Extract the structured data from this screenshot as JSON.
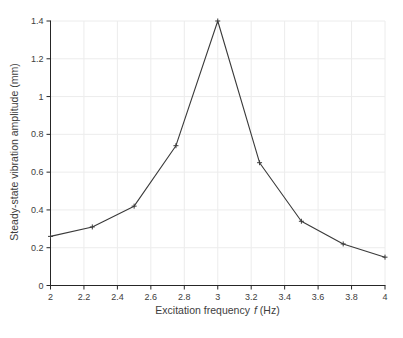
{
  "figure": {
    "background": "#ffffff"
  },
  "chart_data": {
    "type": "line",
    "title": "",
    "xlabel_prefix": "Excitation frequency",
    "xlabel_symbol": "f",
    "xlabel_suffix": "(Hz)",
    "ylabel": "Steady-state vibration amplitude (mm)",
    "x": [
      2,
      2.25,
      2.5,
      2.75,
      3,
      3.25,
      3.5,
      3.75,
      4
    ],
    "y": [
      0.26,
      0.31,
      0.42,
      0.74,
      1.4,
      0.65,
      0.34,
      0.22,
      0.15
    ],
    "xlim": [
      2,
      4
    ],
    "ylim": [
      0,
      1.4
    ],
    "xticks": [
      2,
      2.2,
      2.4,
      2.6,
      2.8,
      3,
      3.2,
      3.4,
      3.6,
      3.8,
      4
    ],
    "xtick_labels": [
      "2",
      "2.2",
      "2.4",
      "2.6",
      "2.8",
      "3",
      "3.2",
      "3.4",
      "3.6",
      "3.8",
      "4"
    ],
    "yticks": [
      0,
      0.2,
      0.4,
      0.6,
      0.8,
      1,
      1.2,
      1.4
    ],
    "ytick_labels": [
      "0",
      "0.2",
      "0.4",
      "0.6",
      "0.8",
      "1",
      "1.2",
      "1.4"
    ],
    "grid": true,
    "legend_position": "none",
    "marker": "plus",
    "colors": {
      "line": "#3a3a3a",
      "marker": "#3a3a3a",
      "grid": "#ececec",
      "axis": "#262626",
      "tick_text": "#3d3d3d"
    }
  }
}
